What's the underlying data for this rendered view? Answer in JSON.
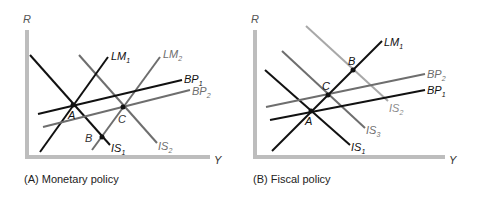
{
  "colors": {
    "black": "#111111",
    "gray": "#6e6e6e",
    "light": "#a8a8a8",
    "axis": "#bdbdbd"
  },
  "panels": [
    {
      "caption": "(A) Monetary policy",
      "axis_y": "R",
      "axis_x": "Y",
      "points": {
        "A": "A",
        "B": "B",
        "C": "C"
      },
      "curves": [
        {
          "name": "LM",
          "sub": "1"
        },
        {
          "name": "LM",
          "sub": "2"
        },
        {
          "name": "BP",
          "sub": "1"
        },
        {
          "name": "BP",
          "sub": "2"
        },
        {
          "name": "IS",
          "sub": "1"
        },
        {
          "name": "IS",
          "sub": "2"
        }
      ]
    },
    {
      "caption": "(B) Fiscal policy",
      "axis_y": "R",
      "axis_x": "Y",
      "points": {
        "A": "A",
        "B": "B",
        "C": "C"
      },
      "curves": [
        {
          "name": "LM",
          "sub": "1"
        },
        {
          "name": "BP",
          "sub": "2"
        },
        {
          "name": "BP",
          "sub": "1"
        },
        {
          "name": "IS",
          "sub": "2"
        },
        {
          "name": "IS",
          "sub": "3"
        },
        {
          "name": "IS",
          "sub": "1"
        }
      ]
    }
  ]
}
